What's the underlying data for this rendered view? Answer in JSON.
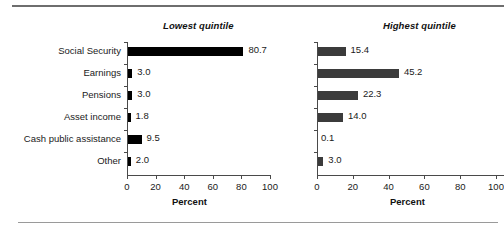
{
  "chart_data": {
    "type": "bar",
    "orientation": "horizontal",
    "categories": [
      "Social Security",
      "Earnings",
      "Pensions",
      "Asset income",
      "Cash public assistance",
      "Other"
    ],
    "panels": [
      {
        "title": "Lowest quintile",
        "xlabel": "Percent",
        "values": [
          80.7,
          3.0,
          3.0,
          1.8,
          9.5,
          2.0
        ],
        "value_labels": [
          "80.7",
          "3.0",
          "3.0",
          "1.8",
          "9.5",
          "2.0"
        ],
        "bar_color": "#000000",
        "xlim": [
          0,
          100
        ],
        "xticks": [
          0,
          20,
          40,
          60,
          80,
          100
        ],
        "xtick_labels": [
          "0",
          "20",
          "40",
          "60",
          "80",
          "100"
        ],
        "show_category_labels": true
      },
      {
        "title": "Highest quintile",
        "xlabel": "Percent",
        "values": [
          15.4,
          45.2,
          22.3,
          14.0,
          0.1,
          3.0
        ],
        "value_labels": [
          "15.4",
          "45.2",
          "22.3",
          "14.0",
          "0.1",
          "3.0"
        ],
        "bar_color": "#3b3b3b",
        "xlim": [
          0,
          100
        ],
        "xticks": [
          0,
          20,
          40,
          60,
          80,
          100
        ],
        "xtick_labels": [
          "0",
          "20",
          "40",
          "60",
          "80",
          "100"
        ],
        "show_category_labels": false
      }
    ],
    "grid": false,
    "legend": "none",
    "title": ""
  }
}
